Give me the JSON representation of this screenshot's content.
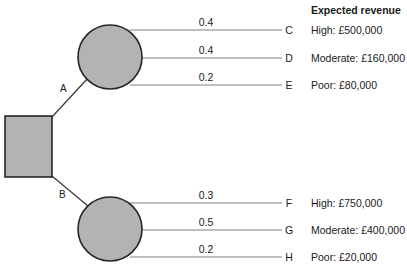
{
  "header": {
    "label": "Expected revenue"
  },
  "decision_node": {
    "name": "decision-square"
  },
  "branches": [
    {
      "label": "A",
      "chance_node": "chance-node-a",
      "outcomes": [
        {
          "probability": "0.4",
          "letter": "C",
          "revenue": "High: £500,000"
        },
        {
          "probability": "0.4",
          "letter": "D",
          "revenue": "Moderate: £160,000"
        },
        {
          "probability": "0.2",
          "letter": "E",
          "revenue": "Poor: £80,000"
        }
      ]
    },
    {
      "label": "B",
      "chance_node": "chance-node-b",
      "outcomes": [
        {
          "probability": "0.3",
          "letter": "F",
          "revenue": "High: £750,000"
        },
        {
          "probability": "0.5",
          "letter": "G",
          "revenue": "Moderate: £400,000"
        },
        {
          "probability": "0.2",
          "letter": "H",
          "revenue": "Poor: £20,000"
        }
      ]
    }
  ],
  "colors": {
    "node_fill": "#b3b3b3",
    "node_stroke": "#262626",
    "branch_line": "#3c3c3c",
    "outcome_line": "#808080",
    "text": "#1a1a1a"
  }
}
